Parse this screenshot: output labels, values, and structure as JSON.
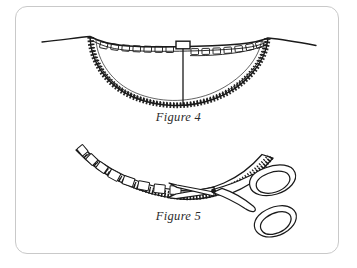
{
  "page": {
    "background_color": "#ffffff",
    "width": 357,
    "height": 268
  },
  "frame": {
    "border_color": "#c9c9c9",
    "corner_radius": 12,
    "fill": "#ffffff"
  },
  "ink": {
    "line_color": "#1a1a1a",
    "fill_color": "#ffffff",
    "caption_color": "#2b2b2b"
  },
  "figures": [
    {
      "id": "figure-4",
      "caption": "Figure 4",
      "subject": "neckline-with-clipped-facing",
      "description": "Curved garment neckline seen from inside, with a facing whose edge is pinked and whose seam allowance is clipped with small notches; a vertical center-front line with a small rectangular tab runs from the neck edge down to the bottom of the curve.",
      "parts": [
        "shoulder-line-left",
        "shoulder-line-right",
        "neckline-curve",
        "facing-edge-pinked",
        "clip-notches",
        "center-front-line",
        "center-front-tab"
      ]
    },
    {
      "id": "figure-5",
      "caption": "Figure 5",
      "subject": "trimming-seam-allowance-with-scissors",
      "description": "A shallow curved seam allowance with pinked edge and clipped notches being trimmed; a pair of open scissors with blades at the left and two oval finger handles at the right.",
      "parts": [
        "seam-curve-pinked",
        "clip-notches",
        "scissors-blades",
        "scissors-pivot-screw",
        "scissors-handle-upper-loop",
        "scissors-handle-lower-loop"
      ]
    }
  ]
}
